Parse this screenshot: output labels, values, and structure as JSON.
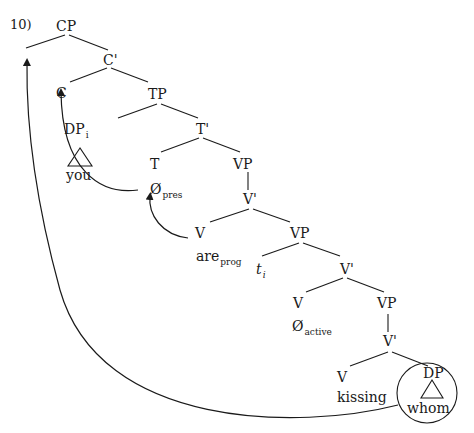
{
  "example_number": "10)",
  "tree": {
    "CP": "CP",
    "C_bar": "C'",
    "C": "C",
    "TP": "TP",
    "DP_subj": {
      "label": "DP",
      "index": "i",
      "word": "you"
    },
    "T_bar": "T'",
    "T": {
      "label": "T",
      "word": "Ø",
      "sub": "pres"
    },
    "VP1": "VP",
    "V_bar1": "V'",
    "V1": {
      "label": "V",
      "word": "are",
      "sub": "prog"
    },
    "VP2": "VP",
    "trace": {
      "label": "t",
      "index": "i"
    },
    "V_bar2": "V'",
    "V2": {
      "label": "V",
      "word": "Ø",
      "sub": "active"
    },
    "VP3": "VP",
    "V_bar3": "V'",
    "V3": {
      "label": "V",
      "word": "kissing"
    },
    "DP_obj": {
      "label": "DP",
      "word": "whom"
    }
  },
  "movements": [
    {
      "from": "T",
      "to": "C",
      "type": "head-movement"
    },
    {
      "from": "V_are",
      "to": "T",
      "type": "head-movement"
    },
    {
      "from": "DP_whom",
      "to": "CP_spec",
      "type": "wh-movement"
    }
  ],
  "colors": {
    "ink": "#1a1a1a",
    "background": "#ffffff"
  }
}
